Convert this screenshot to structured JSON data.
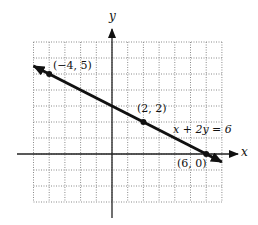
{
  "chart_data": {
    "type": "line",
    "title": "",
    "xlabel": "x",
    "ylabel": "y",
    "xlim": [
      -5,
      7
    ],
    "ylim": [
      -3,
      7
    ],
    "grid": true,
    "grid_style": "dotted",
    "series": [
      {
        "name": "x + 2y = 6",
        "equation": "x + 2y = 6",
        "x": [
          -5,
          7
        ],
        "y": [
          5.5,
          -0.5
        ],
        "arrows": "both"
      }
    ],
    "points": [
      {
        "x": -4,
        "y": 5,
        "label": "(−4, 5)"
      },
      {
        "x": 2,
        "y": 2,
        "label": "(2, 2)"
      },
      {
        "x": 6,
        "y": 0,
        "label": "(6, 0)"
      }
    ],
    "annotations": [
      {
        "text": "x + 2y = 6",
        "x": 4.2,
        "y": 1.5
      }
    ]
  },
  "labels": {
    "x_axis": "x",
    "y_axis": "y",
    "equation": "x + 2y = 6",
    "p1": "(−4, 5)",
    "p2": "(2, 2)",
    "p3": "(6, 0)"
  }
}
